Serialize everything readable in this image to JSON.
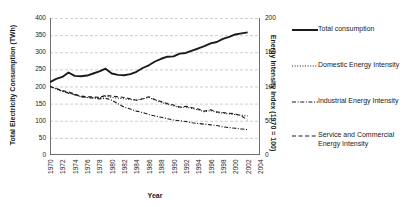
{
  "chart_data": {
    "type": "line",
    "title": "",
    "xlabel": "Year",
    "ylabel": "Total Electricity Consumption (TWh)",
    "y2label": "Energy Intensity Index (1970 = 100)",
    "xlim": [
      1970,
      2004
    ],
    "ylim": [
      0,
      400
    ],
    "y2lim": [
      0,
      200
    ],
    "grid": true,
    "legend_position": "right",
    "yticks": [
      "0",
      "50",
      "100",
      "150",
      "200",
      "250",
      "300",
      "350",
      "400"
    ],
    "y2ticks": [
      "0",
      "50",
      "100",
      "150",
      "200"
    ],
    "x": [
      1970,
      1971,
      1972,
      1973,
      1974,
      1975,
      1976,
      1977,
      1978,
      1979,
      1980,
      1981,
      1982,
      1983,
      1984,
      1985,
      1986,
      1987,
      1988,
      1989,
      1990,
      1991,
      1992,
      1993,
      1994,
      1995,
      1996,
      1997,
      1998,
      1999,
      2000,
      2001,
      2002,
      2003,
      2004
    ],
    "xticks": [
      "1970",
      "1972",
      "1974",
      "1976",
      "1978",
      "1980",
      "1982",
      "1984",
      "1986",
      "1988",
      "1990",
      "1992",
      "1994",
      "1996",
      "1998",
      "2000",
      "2002",
      "2004"
    ],
    "series": [
      {
        "name": "Total consumption",
        "axis": "left",
        "style": "solid",
        "color": "#1a1a1a",
        "values": [
          213,
          222,
          228,
          241,
          231,
          230,
          232,
          238,
          244,
          252,
          238,
          234,
          233,
          236,
          243,
          254,
          262,
          273,
          281,
          287,
          288,
          296,
          298,
          305,
          311,
          318,
          326,
          330,
          339,
          345,
          352,
          355,
          358,
          null,
          null
        ]
      },
      {
        "name": "Domestic Energy Intensity",
        "axis": "right",
        "style": "dotted",
        "color": "#1a1a1a",
        "values": [
          100,
          96,
          93,
          91,
          88,
          85,
          84,
          84,
          83,
          86,
          84,
          83,
          82,
          81,
          80,
          82,
          84,
          80,
          77,
          74,
          72,
          69,
          70,
          68,
          66,
          63,
          65,
          62,
          61,
          60,
          59,
          58,
          57,
          null,
          null
        ]
      },
      {
        "name": "Industrial Energy Intensity",
        "axis": "right",
        "style": "dashdot",
        "color": "#1a1a1a",
        "values": [
          100,
          97,
          93,
          90,
          88,
          85,
          84,
          83,
          82,
          83,
          80,
          75,
          70,
          67,
          64,
          62,
          59,
          57,
          55,
          53,
          51,
          50,
          49,
          47,
          46,
          45,
          44,
          43,
          41,
          40,
          39,
          38,
          37,
          null,
          null
        ]
      },
      {
        "name": "Service and Commercial Energy Intensity",
        "axis": "right",
        "style": "dashed",
        "color": "#1a1a1a",
        "values": [
          100,
          97,
          94,
          92,
          89,
          86,
          85,
          85,
          84,
          87,
          86,
          85,
          84,
          82,
          80,
          82,
          85,
          81,
          78,
          75,
          73,
          70,
          71,
          69,
          67,
          64,
          66,
          63,
          62,
          61,
          60,
          57,
          51,
          null,
          null
        ]
      }
    ]
  },
  "legend": {
    "items": [
      {
        "label": "Total consumption",
        "style": "solid"
      },
      {
        "label": "Domestic Energy Intensity",
        "style": "dotted"
      },
      {
        "label": "Industrial Energy Intensity",
        "style": "dashdot"
      },
      {
        "label": "Service and Commercial Energy Intensity",
        "style": "dashed"
      }
    ]
  }
}
